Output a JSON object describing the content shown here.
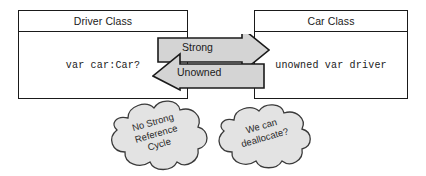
{
  "diagram": {
    "colors": {
      "stroke": "#1a1a1a",
      "box_fill": "#ffffff",
      "arrow_fill": "#d4d4d4",
      "cloud_fill": "#e3e3e3",
      "text": "#1a1a1a"
    },
    "classes": [
      {
        "id": "driver-class",
        "header": "Driver Class",
        "body": "var car:Car?"
      },
      {
        "id": "car-class",
        "header": "Car Class",
        "body": "unowned var driver"
      }
    ],
    "relationship": {
      "name": "double-headed-arrow",
      "forward_label": "Strong",
      "forward_direction": "right",
      "backward_label": "Unowned",
      "backward_direction": "left"
    },
    "clouds": [
      {
        "id": "cloud-left",
        "lines": [
          "No Strong",
          "Reference",
          "Cycle"
        ],
        "text": "No Strong\nReference\nCycle"
      },
      {
        "id": "cloud-right",
        "lines": [
          "We can",
          "deallocate?"
        ],
        "text": "We can\ndeallocate?"
      }
    ]
  }
}
